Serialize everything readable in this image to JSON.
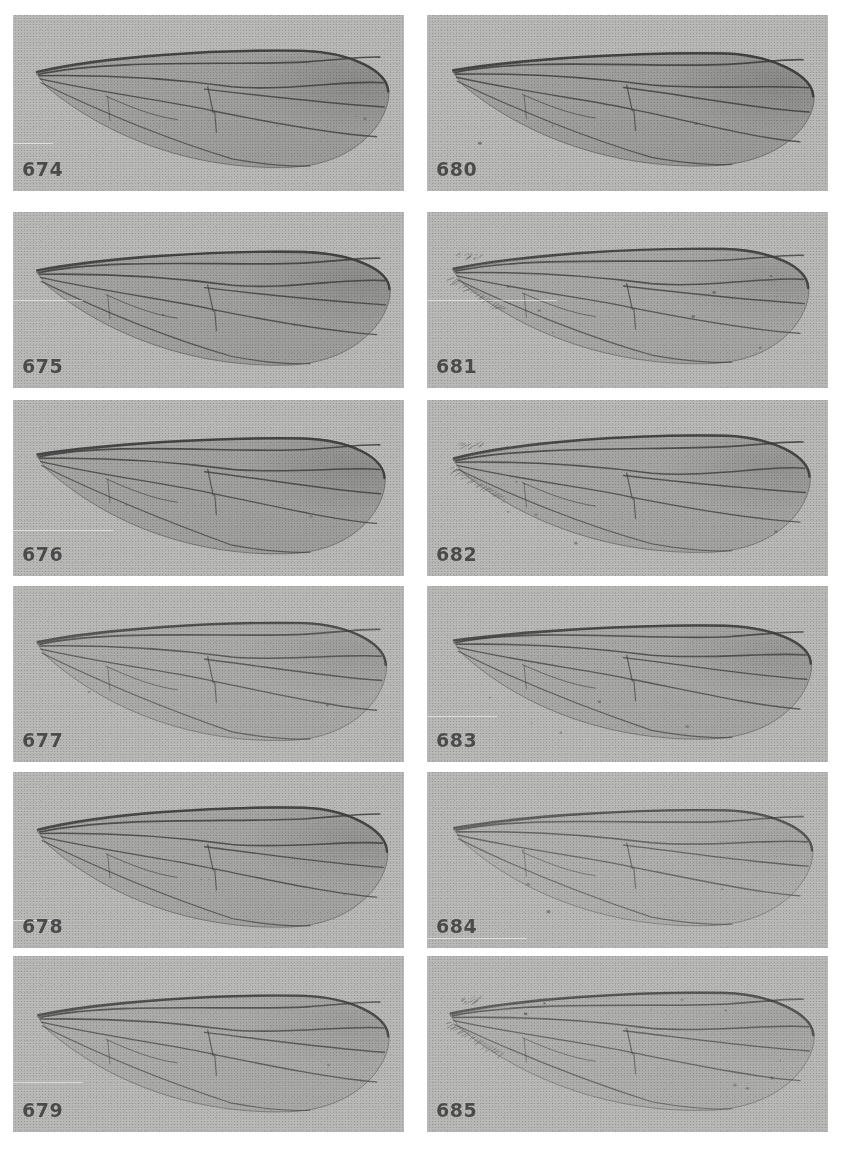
{
  "plate": {
    "title": "Wing plate 674-685",
    "background_color": "#ffffff",
    "panel_background_color": "#b9b9b7",
    "label_color": "#4b4b4b",
    "columns": 2,
    "rows": 6,
    "panel_count": 12
  },
  "panels": [
    {
      "label": "674",
      "column": 0,
      "row": 0,
      "x": 13,
      "y": 15,
      "w": 391,
      "h": 176,
      "tone": "dark",
      "membrane_opacity": 0.34,
      "vein_opacity": 0.9,
      "fringe": false,
      "specks": 3,
      "scratch_top": 128
    },
    {
      "label": "675",
      "column": 0,
      "row": 1,
      "x": 13,
      "y": 212,
      "w": 391,
      "h": 176,
      "tone": "dark",
      "membrane_opacity": 0.33,
      "vein_opacity": 0.9,
      "fringe": false,
      "specks": 2,
      "scratch_top": 88
    },
    {
      "label": "676",
      "column": 0,
      "row": 2,
      "x": 13,
      "y": 400,
      "w": 391,
      "h": 176,
      "tone": "dark",
      "membrane_opacity": 0.32,
      "vein_opacity": 0.9,
      "fringe": false,
      "specks": 3,
      "scratch_top": 130
    },
    {
      "label": "677",
      "column": 0,
      "row": 3,
      "x": 13,
      "y": 586,
      "w": 391,
      "h": 176,
      "tone": "light",
      "membrane_opacity": 0.2,
      "vein_opacity": 0.78,
      "fringe": false,
      "specks": 2,
      "scratch_top": 0
    },
    {
      "label": "678",
      "column": 0,
      "row": 4,
      "x": 13,
      "y": 772,
      "w": 391,
      "h": 176,
      "tone": "mid",
      "membrane_opacity": 0.26,
      "vein_opacity": 0.88,
      "fringe": false,
      "specks": 3,
      "scratch_top": 148
    },
    {
      "label": "679",
      "column": 0,
      "row": 5,
      "x": 13,
      "y": 956,
      "w": 391,
      "h": 176,
      "tone": "light",
      "membrane_opacity": 0.19,
      "vein_opacity": 0.8,
      "fringe": false,
      "specks": 2,
      "scratch_top": 126
    },
    {
      "label": "680",
      "column": 1,
      "row": 0,
      "x": 427,
      "y": 15,
      "w": 401,
      "h": 176,
      "tone": "dark",
      "membrane_opacity": 0.36,
      "vein_opacity": 0.92,
      "fringe": false,
      "specks": 3,
      "scratch_top": 0
    },
    {
      "label": "681",
      "column": 1,
      "row": 1,
      "x": 427,
      "y": 212,
      "w": 401,
      "h": 176,
      "tone": "mid",
      "membrane_opacity": 0.24,
      "vein_opacity": 0.86,
      "fringe": true,
      "specks": 8,
      "scratch_top": 88
    },
    {
      "label": "682",
      "column": 1,
      "row": 2,
      "x": 427,
      "y": 400,
      "w": 401,
      "h": 176,
      "tone": "mid",
      "membrane_opacity": 0.26,
      "vein_opacity": 0.88,
      "fringe": true,
      "specks": 7,
      "scratch_top": 0
    },
    {
      "label": "683",
      "column": 1,
      "row": 3,
      "x": 427,
      "y": 586,
      "w": 401,
      "h": 176,
      "tone": "mid",
      "membrane_opacity": 0.23,
      "vein_opacity": 0.85,
      "fringe": false,
      "specks": 5,
      "scratch_top": 130
    },
    {
      "label": "684",
      "column": 1,
      "row": 4,
      "x": 427,
      "y": 772,
      "w": 401,
      "h": 176,
      "tone": "pale",
      "membrane_opacity": 0.13,
      "vein_opacity": 0.7,
      "fringe": false,
      "specks": 4,
      "scratch_top": 166
    },
    {
      "label": "685",
      "column": 1,
      "row": 5,
      "x": 427,
      "y": 956,
      "w": 401,
      "h": 176,
      "tone": "pale",
      "membrane_opacity": 0.14,
      "vein_opacity": 0.72,
      "fringe": true,
      "specks": 10,
      "scratch_top": 0
    }
  ],
  "specimen_numbers": [
    "674",
    "675",
    "676",
    "677",
    "678",
    "679",
    "680",
    "681",
    "682",
    "683",
    "684",
    "685"
  ]
}
